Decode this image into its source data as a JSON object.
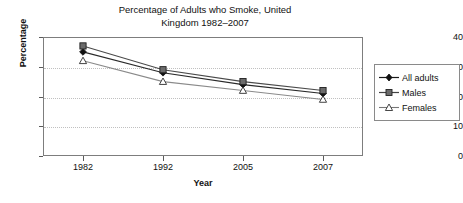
{
  "chart_data": {
    "type": "line",
    "title": "Percentage of Adults who Smoke, United\nKingdom 1982–2007",
    "xlabel": "Year",
    "ylabel": "Percentage",
    "categories": [
      "1982",
      "1992",
      "2005",
      "2007"
    ],
    "ylim": [
      0,
      40
    ],
    "yticks": [
      0,
      10,
      20,
      30,
      40
    ],
    "ytick_labels": [
      "0",
      "10",
      "20",
      "30",
      "40"
    ],
    "grid": true,
    "grid_axis": "y",
    "legend_position": "right-outside",
    "series": [
      {
        "name": "All adults",
        "marker": "filled-diamond",
        "color": "#1a1a1a",
        "values": [
          35,
          28,
          24,
          21
        ]
      },
      {
        "name": "Males",
        "marker": "filled-square",
        "color": "#555555",
        "values": [
          37,
          29,
          25,
          22
        ]
      },
      {
        "name": "Females",
        "marker": "open-triangle",
        "color": "#333333",
        "values": [
          32,
          25,
          22,
          19
        ]
      }
    ]
  },
  "legend": {
    "items": [
      {
        "label": "All adults"
      },
      {
        "label": "Males"
      },
      {
        "label": "Females"
      }
    ]
  },
  "axes": {
    "y_tick_labels": [
      "40",
      "30",
      "20",
      "10",
      "0"
    ],
    "x_tick_labels": [
      "1982",
      "1992",
      "2005",
      "2007"
    ]
  }
}
